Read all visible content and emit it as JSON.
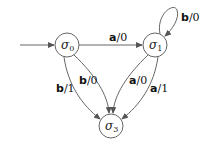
{
  "diagram": {
    "type": "finite-state-transducer",
    "states": [
      {
        "id": "s0",
        "label": "σ",
        "sub": "0",
        "initial": true
      },
      {
        "id": "s1",
        "label": "σ",
        "sub": "1"
      },
      {
        "id": "s3",
        "label": "σ",
        "sub": "3"
      }
    ],
    "transitions": [
      {
        "from": "s0",
        "to": "s1",
        "input": "a",
        "output": "/0"
      },
      {
        "from": "s1",
        "to": "s1",
        "input": "b",
        "output": "/0"
      },
      {
        "from": "s0",
        "to": "s3",
        "input": "b",
        "output": "/0"
      },
      {
        "from": "s0",
        "to": "s3",
        "input": "b",
        "output": "/1"
      },
      {
        "from": "s1",
        "to": "s3",
        "input": "a",
        "output": "/0"
      },
      {
        "from": "s1",
        "to": "s3",
        "input": "a",
        "output": "/1"
      }
    ]
  }
}
